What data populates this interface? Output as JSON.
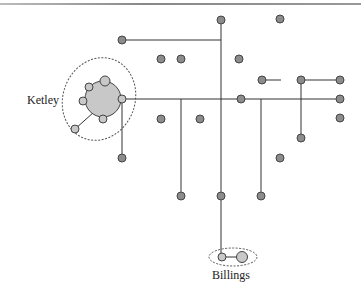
{
  "diagram": {
    "labels": {
      "ketley": "Ketley",
      "billings": "Billings"
    },
    "colors": {
      "node_fill": "#8c8c8c",
      "node_stroke": "#444444",
      "cluster_fill": "#c8c8c8",
      "line": "#333333",
      "dotted": "#555555"
    }
  }
}
